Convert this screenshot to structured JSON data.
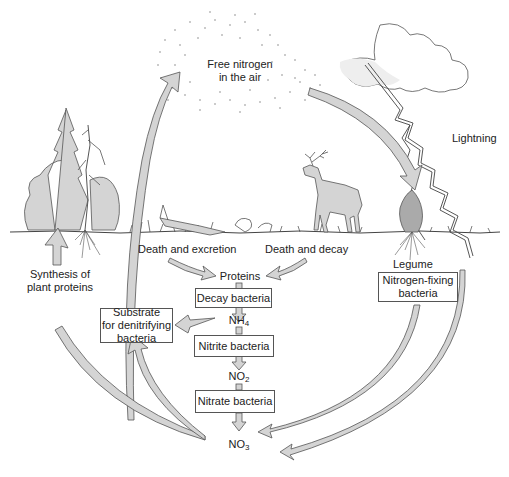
{
  "diagram": {
    "type": "nitrogen-cycle",
    "colors": {
      "fill": "#d4d4d4",
      "stroke": "#555555",
      "text": "#222222",
      "background": "#ffffff"
    },
    "labels": {
      "free_nitrogen_line1": "Free nitrogen",
      "free_nitrogen_line2": "in the air",
      "lightning": "Lightning",
      "death_excretion": "Death and excretion",
      "death_decay": "Death and decay",
      "legume": "Legume",
      "synthesis_line1": "Synthesis of",
      "synthesis_line2": "plant proteins",
      "proteins": "Proteins"
    },
    "boxes": {
      "decay_bacteria": "Decay bacteria",
      "nitrite_bacteria": "Nitrite bacteria",
      "nitrate_bacteria": "Nitrate bacteria",
      "substrate_line1": "Substrate",
      "substrate_line2": "for denitrifying",
      "substrate_line3": "bacteria",
      "nitrogen_fixing_line1": "Nitrogen-fixing",
      "nitrogen_fixing_line2": "bacteria"
    },
    "chemicals": {
      "nh4": {
        "base": "NH",
        "sub": "4"
      },
      "no2": {
        "base": "NO",
        "sub": "2"
      },
      "no3": {
        "base": "NO",
        "sub": "3"
      }
    },
    "illustrations": [
      "cloud-with-dots",
      "storm-cloud",
      "lightning-bolt",
      "trees-and-corn",
      "decaying-log",
      "deer",
      "legume-plant",
      "ground-line"
    ]
  }
}
